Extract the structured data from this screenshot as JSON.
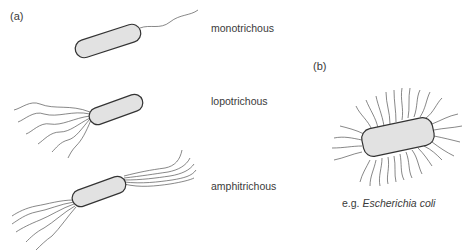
{
  "panels": {
    "a": {
      "label": "(a)",
      "types": [
        {
          "name": "monotrichous"
        },
        {
          "name": "lopotrichous"
        },
        {
          "name": "amphitrichous"
        }
      ]
    },
    "b": {
      "label": "(b)",
      "example_prefix": "e.g. ",
      "example_species": "Escherichia coli"
    }
  },
  "colors": {
    "cell_fill": "#e2e2e2",
    "cell_stroke": "#333333",
    "flagella": "#555555",
    "text": "#3a3a3a"
  }
}
